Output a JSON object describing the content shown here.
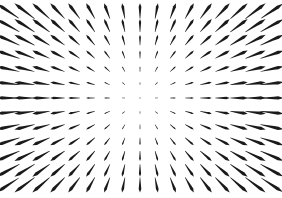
{
  "figure": {
    "title": "",
    "subtitle": "",
    "width": 282,
    "height": 198,
    "background_color": "#ffffff",
    "ink_color": "#1a1a1a"
  },
  "chart_data": {
    "type": "quiver",
    "title": "",
    "subtitle": "",
    "xlabel": "",
    "ylabel": "",
    "field_kind": "radial-source",
    "axes_visible": false,
    "gridlines": false,
    "legend": null,
    "tick_labels": {
      "x": [],
      "y": []
    },
    "xlim": [
      0,
      282
    ],
    "ylim": [
      0,
      198
    ],
    "grid": {
      "columns": 17,
      "rows": 13,
      "x_start": 8,
      "y_start": 11,
      "x_step": 16.5,
      "y_step": 14.5
    },
    "center": {
      "x": 140,
      "y": 99
    },
    "arrow_style": {
      "shape": "tapered-stroke-with-head-blob",
      "color": "#1a1a1a",
      "min_length_px": 1.5,
      "max_length_px": 26,
      "length_scale": 0.175,
      "head_fraction": 0.42,
      "tail_width_px": 0.5,
      "body_width_px": 2.6
    },
    "singularity": {
      "kind": "source",
      "x": 140,
      "y": 99,
      "magnitude_at_center": 0,
      "note": "Vectors vanish at the center and lengthen monotonically outward."
    }
  }
}
